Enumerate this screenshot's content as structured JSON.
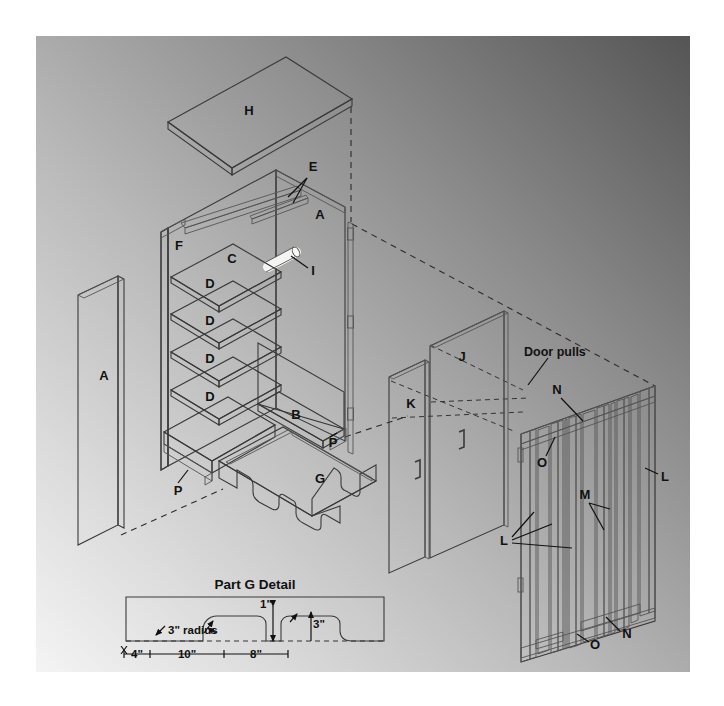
{
  "figure": {
    "kind": "exploded-assembly-drawing",
    "background": {
      "panel_fill_light": "#e9e9e9",
      "panel_fill_dark": "#5f5f5f",
      "page_margin_color": "#ffffff"
    },
    "materials": {
      "face_light": "#f2f2f0",
      "face_mid": "#b4b4b4",
      "face_dark": "#8e8e8e",
      "edge_stroke": "#3a3a3a",
      "label_color": "#111111"
    }
  },
  "part_labels": [
    {
      "id": "H",
      "text": "H",
      "x": 249,
      "y": 115,
      "desc": "top-panel"
    },
    {
      "id": "E",
      "text": "E",
      "x": 313,
      "y": 171,
      "desc": "top-rail"
    },
    {
      "id": "A1",
      "text": "A",
      "x": 320,
      "y": 219,
      "desc": "right-side-panel"
    },
    {
      "id": "F",
      "text": "F",
      "x": 179,
      "y": 250,
      "desc": "left-side-inner"
    },
    {
      "id": "C",
      "text": "C",
      "x": 232,
      "y": 263,
      "desc": "back-panel"
    },
    {
      "id": "I",
      "text": "I",
      "x": 313,
      "y": 275,
      "desc": "hanger-rod"
    },
    {
      "id": "D1",
      "text": "D",
      "x": 210,
      "y": 288,
      "desc": "shelf-1"
    },
    {
      "id": "D2",
      "text": "D",
      "x": 210,
      "y": 323,
      "desc": "shelf-2"
    },
    {
      "id": "D3",
      "text": "D",
      "x": 210,
      "y": 362,
      "desc": "shelf-3"
    },
    {
      "id": "D4",
      "text": "D",
      "x": 210,
      "y": 400,
      "desc": "shelf-4"
    },
    {
      "id": "A2",
      "text": "A",
      "x": 104,
      "y": 380,
      "desc": "left-side-panel"
    },
    {
      "id": "B",
      "text": "B",
      "x": 296,
      "y": 419,
      "desc": "bottom-panel"
    },
    {
      "id": "P1",
      "text": "P",
      "x": 333,
      "y": 442,
      "desc": "cleat-right"
    },
    {
      "id": "P2",
      "text": "P",
      "x": 178,
      "y": 490,
      "desc": "cleat-left"
    },
    {
      "id": "G",
      "text": "G",
      "x": 320,
      "y": 479,
      "desc": "base-apron"
    },
    {
      "id": "K",
      "text": "K",
      "x": 411,
      "y": 404,
      "desc": "door-panel-rear"
    },
    {
      "id": "J",
      "text": "J",
      "x": 462,
      "y": 357,
      "desc": "door-panel-front"
    },
    {
      "id": "N1",
      "text": "N",
      "x": 557,
      "y": 390,
      "desc": "door-rail-top"
    },
    {
      "id": "N2",
      "text": "N",
      "x": 625,
      "y": 634,
      "desc": "door-rail-bottom"
    },
    {
      "id": "O1",
      "text": "O",
      "x": 543,
      "y": 463,
      "desc": "door-stile-inner-top"
    },
    {
      "id": "O2",
      "text": "O",
      "x": 594,
      "y": 645,
      "desc": "door-stile-inner-bottom"
    },
    {
      "id": "L1",
      "text": "L",
      "x": 663,
      "y": 477,
      "desc": "door-stile-outer"
    },
    {
      "id": "L2",
      "text": "L",
      "x": 505,
      "y": 541,
      "desc": "door-stiles-group"
    },
    {
      "id": "M",
      "text": "M",
      "x": 585,
      "y": 495,
      "desc": "door-center-stile"
    }
  ],
  "annotations": {
    "door_pulls": "Door pulls",
    "detail_title": "Part G Detail"
  },
  "detail_dimensions": [
    {
      "id": "radius",
      "text": "3\" radius",
      "x": 168,
      "y": 630
    },
    {
      "id": "notch-h",
      "text": "1\"",
      "x": 272,
      "y": 618
    },
    {
      "id": "notch-r",
      "text": "3\"",
      "x": 313,
      "y": 626
    },
    {
      "id": "d-4",
      "text": "4\"",
      "x": 136,
      "y": 650
    },
    {
      "id": "d-10",
      "text": "10\"",
      "x": 188,
      "y": 650
    },
    {
      "id": "d-8",
      "text": "8\"",
      "x": 252,
      "y": 650
    }
  ],
  "legend_ids": [
    "A",
    "B",
    "C",
    "D",
    "E",
    "F",
    "G",
    "H",
    "I",
    "J",
    "K",
    "L",
    "M",
    "N",
    "O",
    "P"
  ]
}
